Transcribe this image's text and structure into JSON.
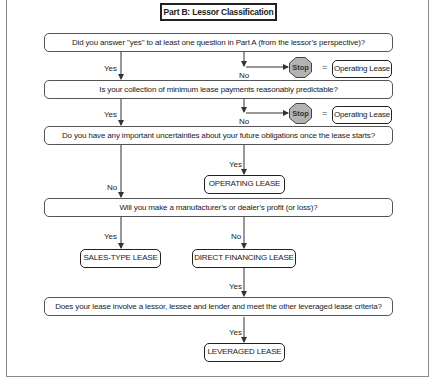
{
  "title": "Part B: Lessor Classification",
  "questions": [
    {
      "text": "Did you answer \"yes\" to at least one question in Part A (from the lessor’s perspective)?"
    },
    {
      "text": "Is your collection of minimum lease payments reasonably predictable?"
    },
    {
      "text": "Do you have any important uncertainties about your future obligations once the lease starts?"
    },
    {
      "text": "Will you make a manufacturer’s or dealer’s profit (or loss)?"
    },
    {
      "text": "Does your lease involve a lessor, lessee and lender and meet the other leveraged lease criteria?"
    }
  ],
  "stop_branches": [
    {
      "branch": "No",
      "stop_label": "Stop",
      "equals": "=",
      "result": "Operating Lease"
    },
    {
      "branch": "No",
      "stop_label": "Stop",
      "equals": "=",
      "result": "Operating Lease"
    }
  ],
  "continue_labels": [
    "Yes",
    "Yes"
  ],
  "q3_branches": {
    "yes": "Yes",
    "no": "No",
    "yes_result": "OPERATING LEASE"
  },
  "q4_branches": {
    "yes": "Yes",
    "no": "No",
    "yes_result": "SALES-TYPE LEASE",
    "no_result": "DIRECT FINANCING LEASE"
  },
  "q5_link": {
    "into": "Yes",
    "yes": "Yes",
    "yes_result": "LEVERAGED LEASE"
  },
  "colors": {
    "line": "#333333",
    "stop_fill": "#b3b3b3",
    "frame": "#8a8a8a"
  }
}
